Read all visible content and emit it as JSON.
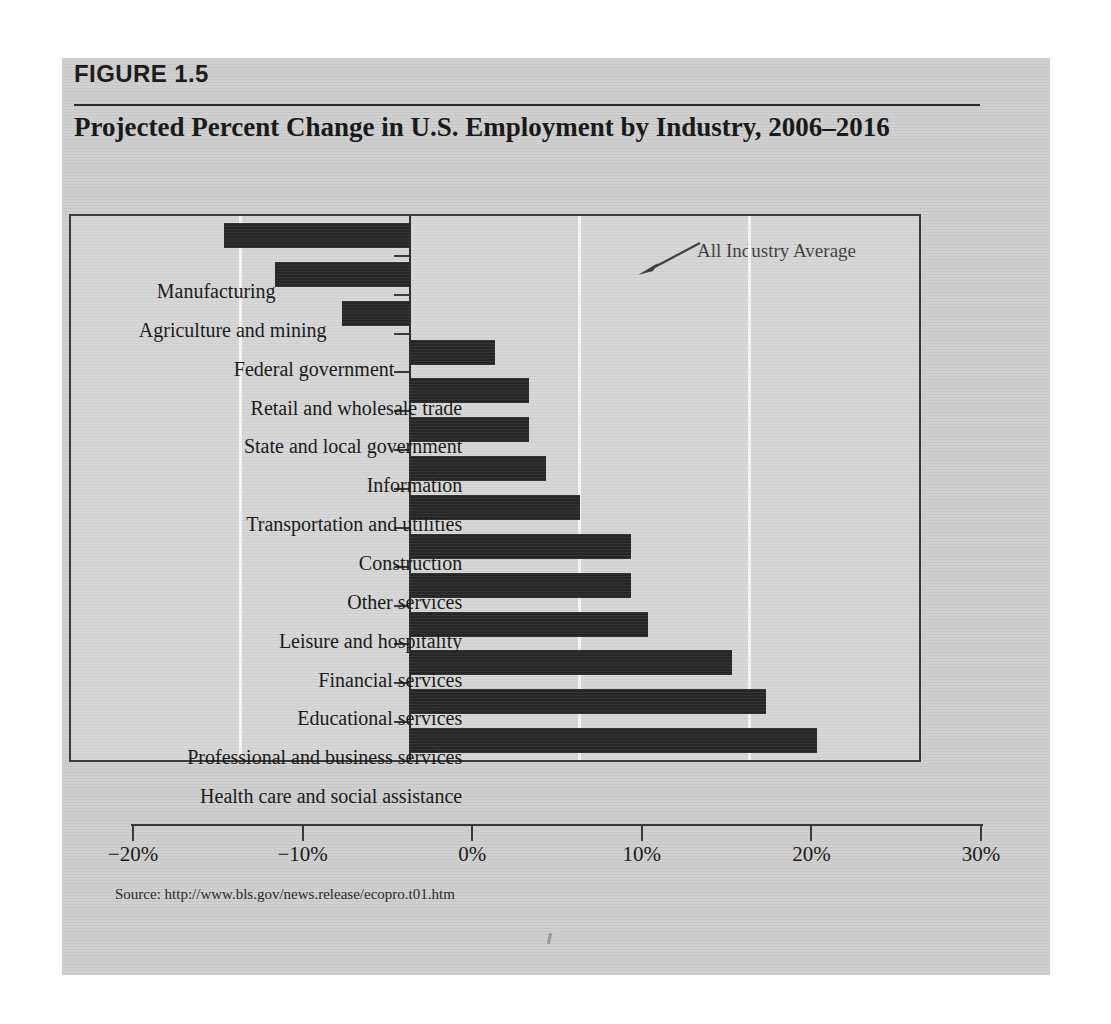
{
  "figure": {
    "label": "FIGURE 1.5",
    "title": "Projected Percent Change in U.S. Employment by Industry, 2006–2016",
    "source": "Source: http://www.bls.gov/news.release/ecopro.t01.htm"
  },
  "colors": {
    "page_background": "#cdcdcd",
    "bar_fill": "#262626",
    "frame_border": "#3a3a3a",
    "gridline": "#f2f2f2",
    "text": "#1b1b1b"
  },
  "chart_data": {
    "type": "bar",
    "orientation": "horizontal",
    "title": "Projected Percent Change in U.S. Employment by Industry, 2006–2016",
    "xlabel": "",
    "ylabel": "",
    "xlim": [
      -20,
      30
    ],
    "ylim": null,
    "grid": true,
    "grid_axis": "x",
    "legend": null,
    "xticks": [
      -20,
      -10,
      0,
      10,
      20,
      30
    ],
    "xtick_labels": [
      "−20%",
      "−10%",
      "0%",
      "10%",
      "20%",
      "30%"
    ],
    "categories": [
      "Manufacturing",
      "Agriculture and mining",
      "Federal government",
      "Retail and wholesale trade",
      "State and local government",
      "Information",
      "Transportation and utilities",
      "Construction",
      "Other services",
      "Leisure and hospitality",
      "Financial services",
      "Educational services",
      "Professional and business services",
      "Health care and social assistance"
    ],
    "values": [
      -11,
      -8,
      -4,
      5,
      7,
      7,
      8,
      10,
      13,
      13,
      14,
      19,
      21,
      24
    ],
    "annotations": [
      {
        "text": "All Industry Average",
        "points_to_x": 10,
        "points_to_y": "top-of-plot"
      }
    ]
  },
  "annotation": {
    "all_industry_average": "All Industry Average"
  }
}
